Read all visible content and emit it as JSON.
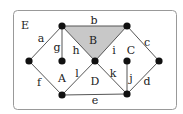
{
  "diagram": {
    "type": "planar-graph",
    "frame": {
      "x": 13,
      "y": 10,
      "w": 163,
      "h": 99,
      "rx": 4,
      "stroke": "#999999"
    },
    "fill_region_color": "#c8c8c8",
    "vertices": [
      {
        "id": "v1",
        "x": 62,
        "y": 26
      },
      {
        "id": "v2",
        "x": 127,
        "y": 26
      },
      {
        "id": "v3",
        "x": 29,
        "y": 61
      },
      {
        "id": "v4",
        "x": 62,
        "y": 61
      },
      {
        "id": "v5",
        "x": 95,
        "y": 61
      },
      {
        "id": "v6",
        "x": 127,
        "y": 61
      },
      {
        "id": "v7",
        "x": 159,
        "y": 61
      },
      {
        "id": "v8",
        "x": 62,
        "y": 95
      },
      {
        "id": "v9",
        "x": 127,
        "y": 94
      }
    ],
    "edges": [
      {
        "label": "a",
        "from": "v3",
        "to": "v1",
        "lx": 41,
        "ly": 42
      },
      {
        "label": "b",
        "from": "v1",
        "to": "v2",
        "lx": 94,
        "ly": 24
      },
      {
        "label": "c",
        "from": "v2",
        "to": "v7",
        "lx": 147,
        "ly": 46
      },
      {
        "label": "d",
        "from": "v7",
        "to": "v9",
        "lx": 147,
        "ly": 85
      },
      {
        "label": "e",
        "from": "v8",
        "to": "v9",
        "lx": 95,
        "ly": 104
      },
      {
        "label": "f",
        "from": "v3",
        "to": "v8",
        "lx": 39,
        "ly": 86
      },
      {
        "label": "g",
        "from": "v1",
        "to": "v4",
        "lx": 57,
        "ly": 51
      },
      {
        "label": "h",
        "from": "v1",
        "to": "v5",
        "lx": 76,
        "ly": 54
      },
      {
        "label": "i",
        "from": "v2",
        "to": "v5",
        "lx": 114,
        "ly": 54
      },
      {
        "label": "j",
        "from": "v6",
        "to": "v9",
        "lx": 131,
        "ly": 82
      },
      {
        "label": "k",
        "from": "v5",
        "to": "v9",
        "lx": 113,
        "ly": 77
      },
      {
        "label": "l",
        "from": "v5",
        "to": "v8",
        "lx": 77,
        "ly": 77
      }
    ],
    "faces": [
      {
        "label": "E",
        "lx": 25,
        "ly": 29
      },
      {
        "label": "B",
        "lx": 93,
        "ly": 44
      },
      {
        "label": "C",
        "lx": 131,
        "ly": 54
      },
      {
        "label": "A",
        "lx": 62,
        "ly": 82
      },
      {
        "label": "D",
        "lx": 95,
        "ly": 85
      }
    ],
    "shaded_face": "B"
  }
}
